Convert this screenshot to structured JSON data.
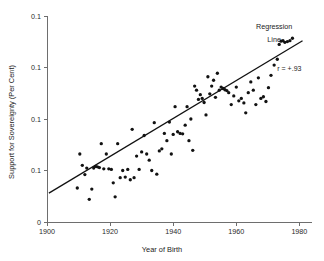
{
  "chart_data": {
    "type": "scatter",
    "title": "",
    "xlabel": "Year of Birth",
    "ylabel": "Support for Sovereignty (Per Cent)",
    "xlim": [
      1900,
      1984
    ],
    "ylim": [
      0,
      0.1
    ],
    "grid": false,
    "x_ticks": [
      1900,
      1920,
      1940,
      1960,
      1980
    ],
    "x_tick_labels": [
      "1900",
      "1920",
      "1940",
      "1960",
      "1980"
    ],
    "y_ticks": [
      0.1,
      0.075,
      0.05,
      0.025,
      0
    ],
    "y_tick_labels": [
      "0.1",
      "0.1",
      "0.1",
      "0.1",
      "0"
    ],
    "annotations": [
      {
        "name": "regression-line-label",
        "text": "Regression",
        "x": 1972,
        "y": 0.0935
      },
      {
        "name": "regression-line-label-2",
        "text": "Line",
        "x": 1972,
        "y": 0.0875
      },
      {
        "name": "correlation-label",
        "text": "r = +.93",
        "x": 1973,
        "y": 0.0735
      }
    ],
    "series": [
      {
        "name": "Support for Sovereignty",
        "marker": "circle",
        "color": "#121212",
        "points": [
          [
            1909.6,
            0.0165
          ],
          [
            1910.4,
            0.033
          ],
          [
            1911.2,
            0.0275
          ],
          [
            1912.0,
            0.023
          ],
          [
            1912.6,
            0.0262
          ],
          [
            1913.4,
            0.011
          ],
          [
            1914.2,
            0.016
          ],
          [
            1914.8,
            0.0262
          ],
          [
            1915.4,
            0.027
          ],
          [
            1916.0,
            0.0268
          ],
          [
            1916.6,
            0.0264
          ],
          [
            1917.2,
            0.038
          ],
          [
            1918.0,
            0.0258
          ],
          [
            1918.8,
            0.033
          ],
          [
            1919.6,
            0.0258
          ],
          [
            1920.4,
            0.0255
          ],
          [
            1921.0,
            0.019
          ],
          [
            1921.6,
            0.0122
          ],
          [
            1922.4,
            0.038
          ],
          [
            1923.2,
            0.0215
          ],
          [
            1924.0,
            0.025
          ],
          [
            1924.8,
            0.0218
          ],
          [
            1925.6,
            0.0255
          ],
          [
            1926.4,
            0.0205
          ],
          [
            1927.0,
            0.045
          ],
          [
            1927.6,
            0.0215
          ],
          [
            1928.4,
            0.032
          ],
          [
            1929.2,
            0.0255
          ],
          [
            1930.0,
            0.034
          ],
          [
            1930.8,
            0.042
          ],
          [
            1931.6,
            0.033
          ],
          [
            1932.4,
            0.03
          ],
          [
            1933.2,
            0.025
          ],
          [
            1934.0,
            0.0482
          ],
          [
            1934.8,
            0.0232
          ],
          [
            1935.6,
            0.0345
          ],
          [
            1936.4,
            0.0355
          ],
          [
            1937.2,
            0.043
          ],
          [
            1938.0,
            0.0395
          ],
          [
            1938.8,
            0.0485
          ],
          [
            1939.4,
            0.033
          ],
          [
            1940.0,
            0.0425
          ],
          [
            1940.6,
            0.056
          ],
          [
            1941.4,
            0.0438
          ],
          [
            1942.2,
            0.043
          ],
          [
            1943.0,
            0.0428
          ],
          [
            1943.8,
            0.047
          ],
          [
            1944.4,
            0.056
          ],
          [
            1945.0,
            0.0395
          ],
          [
            1945.6,
            0.05
          ],
          [
            1946.2,
            0.0348
          ],
          [
            1946.8,
            0.066
          ],
          [
            1947.4,
            0.064
          ],
          [
            1948.0,
            0.0595
          ],
          [
            1948.6,
            0.0618
          ],
          [
            1949.2,
            0.06
          ],
          [
            1949.8,
            0.058
          ],
          [
            1950.4,
            0.052
          ],
          [
            1951.0,
            0.0705
          ],
          [
            1951.6,
            0.0622
          ],
          [
            1952.2,
            0.066
          ],
          [
            1952.8,
            0.0688
          ],
          [
            1953.4,
            0.0605
          ],
          [
            1954.0,
            0.0722
          ],
          [
            1954.6,
            0.064
          ],
          [
            1955.2,
            0.0655
          ],
          [
            1955.8,
            0.0648
          ],
          [
            1956.4,
            0.0642
          ],
          [
            1957.0,
            0.0638
          ],
          [
            1957.6,
            0.0628
          ],
          [
            1958.4,
            0.057
          ],
          [
            1959.2,
            0.0612
          ],
          [
            1960.0,
            0.0655
          ],
          [
            1960.8,
            0.0588
          ],
          [
            1961.6,
            0.06
          ],
          [
            1962.4,
            0.0578
          ],
          [
            1963.0,
            0.053
          ],
          [
            1963.8,
            0.0628
          ],
          [
            1964.6,
            0.068
          ],
          [
            1965.4,
            0.064
          ],
          [
            1966.2,
            0.057
          ],
          [
            1967.0,
            0.07
          ],
          [
            1967.8,
            0.06
          ],
          [
            1968.6,
            0.0608
          ],
          [
            1969.4,
            0.0585
          ],
          [
            1970.2,
            0.0652
          ],
          [
            1971.0,
            0.0712
          ],
          [
            1972.0,
            0.0762
          ],
          [
            1973.0,
            0.079
          ],
          [
            1973.6,
            0.0862
          ],
          [
            1974.2,
            0.0878
          ],
          [
            1974.8,
            0.088
          ],
          [
            1975.4,
            0.0872
          ],
          [
            1976.2,
            0.0876
          ],
          [
            1977.0,
            0.088
          ],
          [
            1977.8,
            0.0892
          ]
        ]
      }
    ],
    "regression_line": {
      "name": "Regression Line",
      "x_start": 1900.6,
      "y_start": 0.014,
      "x_end": 1981.0,
      "y_end": 0.088,
      "r": "+.93"
    }
  }
}
